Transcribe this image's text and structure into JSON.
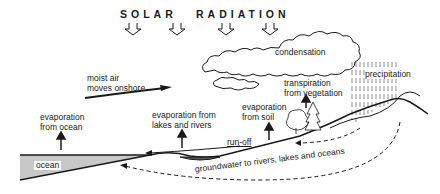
{
  "title": {
    "word1": "SOLAR",
    "word2": "RADIATION"
  },
  "labels": {
    "condensation": "condensation",
    "moist_air_line1": "moist air",
    "moist_air_line2": "moves onshore",
    "precipitation": "precipitation",
    "transpiration_line1": "transpiration",
    "transpiration_line2": "from vegetation",
    "evap_ocean_line1": "evaporation",
    "evap_ocean_line2": "from ocean",
    "evap_lakes_line1": "evaporation from",
    "evap_lakes_line2": "lakes and rivers",
    "evap_soil_line1": "evaporation",
    "evap_soil_line2": "from soil",
    "runoff": "run-off",
    "ocean": "ocean",
    "groundwater": "groundwater to rivers, lakes and oceans"
  },
  "colors": {
    "line": "#1a1a1a",
    "ocean_fill": "#c8c8c8",
    "background": "#ffffff"
  }
}
